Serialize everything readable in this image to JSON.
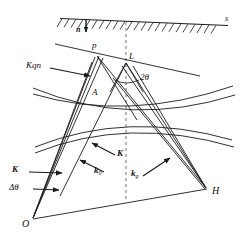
{
  "figure": {
    "background": "#ffffff",
    "ink": "#1a1a1a",
    "dash_color": "#9a9a9a",
    "width": 245,
    "height": 238
  },
  "labels": {
    "surface": "s",
    "normal": "n",
    "point_p": "p",
    "point_L": "L",
    "point_A": "A",
    "point_O": "O",
    "point_H": "H",
    "angle_two_theta": "2θ",
    "vector_Kqn": "Kqn",
    "vector_K_upper": "K",
    "vector_K_lower": "K",
    "delta_theta": "Δθ",
    "k_zero": "k",
    "k_zero_sub": "0",
    "k_g": "k",
    "k_g_sub": "g"
  },
  "geometry": {
    "surface_line": {
      "x1": 60,
      "y1": 18,
      "x2": 228,
      "y2": 25
    },
    "normal_arrow": {
      "x1": 85,
      "y1": 18,
      "x2": 85,
      "y2": 32
    },
    "dashed_axis": {
      "x": 126,
      "y1": 22,
      "x2": 126,
      "y2": 200
    },
    "p": {
      "x": 97,
      "y": 56
    },
    "L": {
      "x": 126,
      "y": 63
    },
    "A": {
      "x": 97,
      "y": 97
    },
    "O": {
      "x": 33,
      "y": 219
    },
    "H": {
      "x": 207,
      "y": 190
    },
    "arcs": [
      {
        "name": "arc-upper-left",
        "d": "M 35 95 Q 125 118 230 88"
      },
      {
        "name": "arc-upper-right",
        "d": "M 28 88 Q 130 122 232 93"
      },
      {
        "name": "arc-mid-left",
        "d": "M 36 146 Q 128 112 230 142"
      },
      {
        "name": "arc-mid-right",
        "d": "M 36 152 Q 128 118 232 148"
      }
    ]
  }
}
